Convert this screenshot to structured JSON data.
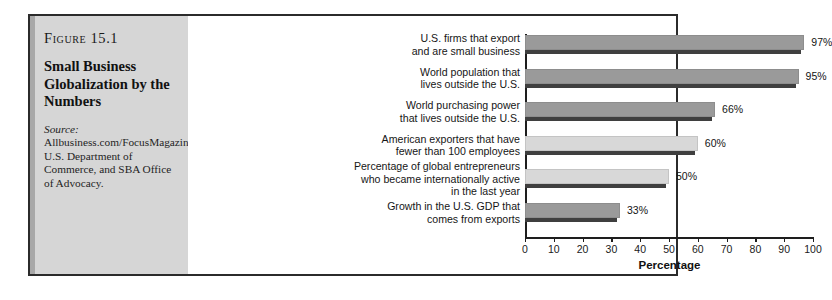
{
  "figure": {
    "label": "Figure 15.1",
    "title": "Small Business Globalization by the Numbers",
    "source_label": "Source:",
    "source_text": " Allbusiness.com/FocusMagazine/GoingGlobal, U.S. Department of Commerce, and SBA Office of Advocacy."
  },
  "colors": {
    "panel_background": "#d6d6d6",
    "panel_accent": "#a8a8a8",
    "border": "#2b2b2b",
    "bar_dark": "#9a9a9a",
    "bar_light": "#d8d8d8",
    "bar_shadow": "#3f3f3f",
    "axis": "#1e1e1e",
    "chart_background": "#ffffff"
  },
  "chart_data": {
    "type": "bar",
    "orientation": "horizontal",
    "title": "Small Business Globalization by the Numbers",
    "xlabel": "Percentage",
    "ylabel": "",
    "xlim": [
      0,
      100
    ],
    "xticks": [
      0,
      10,
      20,
      30,
      40,
      50,
      60,
      70,
      80,
      90,
      100
    ],
    "xtick_labels": [
      "0",
      "10",
      "20",
      "30",
      "40",
      "50",
      "60",
      "70",
      "80",
      "90",
      "100"
    ],
    "grid": false,
    "legend": false,
    "categories": [
      "U.S. firms that export and are small business",
      "World population that lives outside the U.S.",
      "World purchasing power that lives outside the U.S.",
      "American exporters that have fewer than 100 employees",
      "Percentage of global entrepreneurs who became internationally active in the last year",
      "Growth in the U.S. GDP that comes from exports"
    ],
    "values": [
      97,
      95,
      66,
      60,
      50,
      33
    ],
    "value_labels": [
      "97%",
      "95%",
      "66%",
      "60%",
      "50%",
      "33%"
    ],
    "bars": [
      {
        "label_lines": [
          "U.S. firms that export",
          "and are small business"
        ],
        "value": 97,
        "value_label": "97%",
        "shade": "dark"
      },
      {
        "label_lines": [
          "World population that",
          "lives outside the U.S."
        ],
        "value": 95,
        "value_label": "95%",
        "shade": "dark"
      },
      {
        "label_lines": [
          "World purchasing power",
          "that lives outside the U.S."
        ],
        "value": 66,
        "value_label": "66%",
        "shade": "dark"
      },
      {
        "label_lines": [
          "American exporters that have",
          "fewer than 100 employees"
        ],
        "value": 60,
        "value_label": "60%",
        "shade": "light"
      },
      {
        "label_lines": [
          "Percentage of global entrepreneurs",
          "who became internationally active",
          "in the last year"
        ],
        "value": 50,
        "value_label": "50%",
        "shade": "light"
      },
      {
        "label_lines": [
          "Growth in the U.S. GDP that",
          "comes from exports"
        ],
        "value": 33,
        "value_label": "33%",
        "shade": "dark"
      }
    ]
  }
}
